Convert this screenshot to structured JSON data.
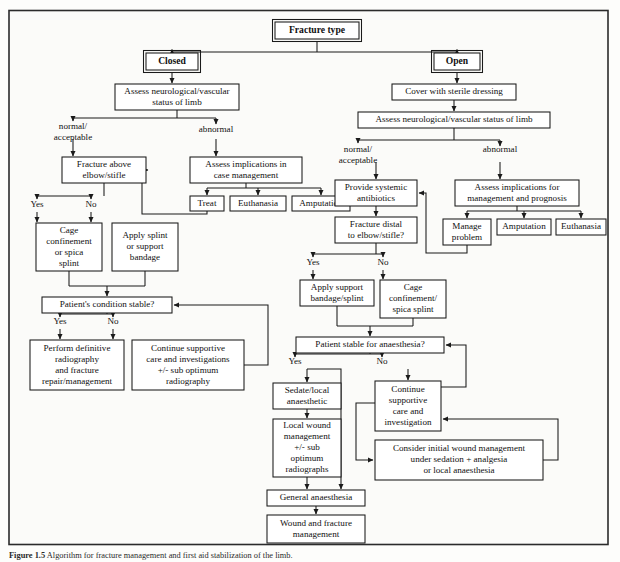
{
  "figure": {
    "caption_label": "Figure 1.5",
    "caption_text": "Algorithm for fracture management and first aid stabilization of the limb."
  },
  "nodes": [
    {
      "id": "fracture_type",
      "label": "Fracture type",
      "x": 275,
      "y": 22,
      "w": 84,
      "h": 17,
      "style": "double",
      "bold": true
    },
    {
      "id": "closed",
      "label": "Closed",
      "x": 146,
      "y": 53,
      "w": 52,
      "h": 17,
      "style": "double",
      "bold": true
    },
    {
      "id": "open",
      "label": "Open",
      "x": 434,
      "y": 53,
      "w": 46,
      "h": 17,
      "style": "double",
      "bold": true
    },
    {
      "id": "closed_assess",
      "label": "Assess neurological/vascular|status of limb",
      "x": 115,
      "y": 84,
      "w": 124,
      "h": 26,
      "style": "single",
      "bold": false
    },
    {
      "id": "open_cover",
      "label": "Cover with sterile dressing",
      "x": 392,
      "y": 84,
      "w": 124,
      "h": 16,
      "style": "single",
      "bold": false
    },
    {
      "id": "open_assess",
      "label": "Assess neurological/vascular status of limb",
      "x": 358,
      "y": 112,
      "w": 192,
      "h": 16,
      "style": "single",
      "bold": false
    },
    {
      "id": "frac_above",
      "label": "Fracture above|elbow/stifle",
      "x": 62,
      "y": 157,
      "w": 84,
      "h": 26,
      "style": "single",
      "bold": false
    },
    {
      "id": "assess_impl_c",
      "label": "Assess implications in|case management",
      "x": 190,
      "y": 157,
      "w": 112,
      "h": 26,
      "style": "single",
      "bold": false
    },
    {
      "id": "treat",
      "label": "Treat",
      "x": 190,
      "y": 196,
      "w": 34,
      "h": 15,
      "style": "single",
      "bold": false
    },
    {
      "id": "euthanasia_c",
      "label": "Euthanasia",
      "x": 230,
      "y": 196,
      "w": 56,
      "h": 15,
      "style": "single",
      "bold": false
    },
    {
      "id": "amputation_c",
      "label": "Amputation",
      "x": 292,
      "y": 196,
      "w": 58,
      "h": 15,
      "style": "single",
      "bold": false
    },
    {
      "id": "cage_conf_l",
      "label": "Cage|confinement|or spica|splint",
      "x": 36,
      "y": 223,
      "w": 66,
      "h": 48,
      "style": "single",
      "bold": false
    },
    {
      "id": "apply_splint_l",
      "label": "Apply splint|or support|bandage",
      "x": 112,
      "y": 223,
      "w": 66,
      "h": 48,
      "style": "single",
      "bold": false
    },
    {
      "id": "pat_stable_l",
      "label": "Patient's condition stable?",
      "x": 42,
      "y": 297,
      "w": 130,
      "h": 16,
      "style": "single",
      "bold": false
    },
    {
      "id": "perform_def",
      "label": "Perform definitive|radiography|and fracture|repair/management",
      "x": 30,
      "y": 340,
      "w": 94,
      "h": 50,
      "style": "single",
      "bold": false
    },
    {
      "id": "cont_supp_l",
      "label": "Continue supportive|care and investigations|+/- sub optimum|radiography",
      "x": 132,
      "y": 340,
      "w": 112,
      "h": 50,
      "style": "single",
      "bold": false
    },
    {
      "id": "provide_ab",
      "label": "Provide systemic|antibiotics",
      "x": 335,
      "y": 180,
      "w": 82,
      "h": 26,
      "style": "single",
      "bold": false
    },
    {
      "id": "assess_impl_o",
      "label": "Assess implications for|management and prognosis",
      "x": 455,
      "y": 180,
      "w": 124,
      "h": 26,
      "style": "single",
      "bold": false
    },
    {
      "id": "frac_distal",
      "label": "Fracture distal|to elbow/stifle?",
      "x": 335,
      "y": 217,
      "w": 82,
      "h": 26,
      "style": "single",
      "bold": false
    },
    {
      "id": "manage_prob",
      "label": "Manage|problem",
      "x": 443,
      "y": 219,
      "w": 48,
      "h": 26,
      "style": "single",
      "bold": false
    },
    {
      "id": "amputation_o",
      "label": "Amputation",
      "x": 497,
      "y": 219,
      "w": 54,
      "h": 16,
      "style": "single",
      "bold": false
    },
    {
      "id": "euthanasia_o",
      "label": "Euthanasia",
      "x": 556,
      "y": 219,
      "w": 50,
      "h": 16,
      "style": "single",
      "bold": false
    },
    {
      "id": "apply_supp_o",
      "label": "Apply support|bandage/splint",
      "x": 300,
      "y": 280,
      "w": 74,
      "h": 26,
      "style": "single",
      "bold": false
    },
    {
      "id": "cage_conf_o",
      "label": "Cage|confinement/|spica splint",
      "x": 380,
      "y": 280,
      "w": 66,
      "h": 38,
      "style": "single",
      "bold": false
    },
    {
      "id": "pat_stable_o",
      "label": "Patient stable for anaesthesia?",
      "x": 296,
      "y": 337,
      "w": 148,
      "h": 16,
      "style": "single",
      "bold": false
    },
    {
      "id": "sedate_local",
      "label": "Sedate/local|anaesthetic",
      "x": 273,
      "y": 383,
      "w": 68,
      "h": 26,
      "style": "single",
      "bold": false
    },
    {
      "id": "local_wound",
      "label": "Local wound|management|+/- sub|optimum|radiographs",
      "x": 273,
      "y": 419,
      "w": 68,
      "h": 58,
      "style": "single",
      "bold": false
    },
    {
      "id": "cont_supp_o",
      "label": "Continue|supportive|care and|investigation",
      "x": 375,
      "y": 381,
      "w": 66,
      "h": 50,
      "style": "single",
      "bold": false
    },
    {
      "id": "consider_init",
      "label": "Consider initial wound management|under sedation + analgesia|or local anaesthesia",
      "x": 375,
      "y": 440,
      "w": 168,
      "h": 40,
      "style": "single",
      "bold": false
    },
    {
      "id": "gen_anaes",
      "label": "General anaesthesia",
      "x": 267,
      "y": 490,
      "w": 98,
      "h": 16,
      "style": "single",
      "bold": false
    },
    {
      "id": "wound_frac",
      "label": "Wound and fracture|management",
      "x": 267,
      "y": 515,
      "w": 98,
      "h": 28,
      "style": "single",
      "bold": false
    }
  ],
  "edge_labels": [
    {
      "id": "closed_normal",
      "text": "normal/|acceptable",
      "x": 73,
      "y": 127
    },
    {
      "id": "closed_abnormal",
      "text": "abnormal",
      "x": 216,
      "y": 130
    },
    {
      "id": "open_normal",
      "text": "normal/|acceptable",
      "x": 358,
      "y": 150
    },
    {
      "id": "open_abnormal",
      "text": "abnormal",
      "x": 500,
      "y": 150
    },
    {
      "id": "frac_above_yes",
      "text": "Yes",
      "x": 37,
      "y": 205
    },
    {
      "id": "frac_above_no",
      "text": "No",
      "x": 91,
      "y": 205
    },
    {
      "id": "stable_l_yes",
      "text": "Yes",
      "x": 60,
      "y": 322
    },
    {
      "id": "stable_l_no",
      "text": "No",
      "x": 113,
      "y": 322
    },
    {
      "id": "distal_yes",
      "text": "Yes",
      "x": 313,
      "y": 263
    },
    {
      "id": "distal_no",
      "text": "No",
      "x": 383,
      "y": 263
    },
    {
      "id": "anaes_yes",
      "text": "Yes",
      "x": 295,
      "y": 362
    },
    {
      "id": "anaes_no",
      "text": "No",
      "x": 382,
      "y": 362
    }
  ],
  "colors": {
    "page_background": "#fdfdfb",
    "frame_background": "#fbfbf9",
    "border": "#1a1a1a",
    "text": "#101010"
  }
}
